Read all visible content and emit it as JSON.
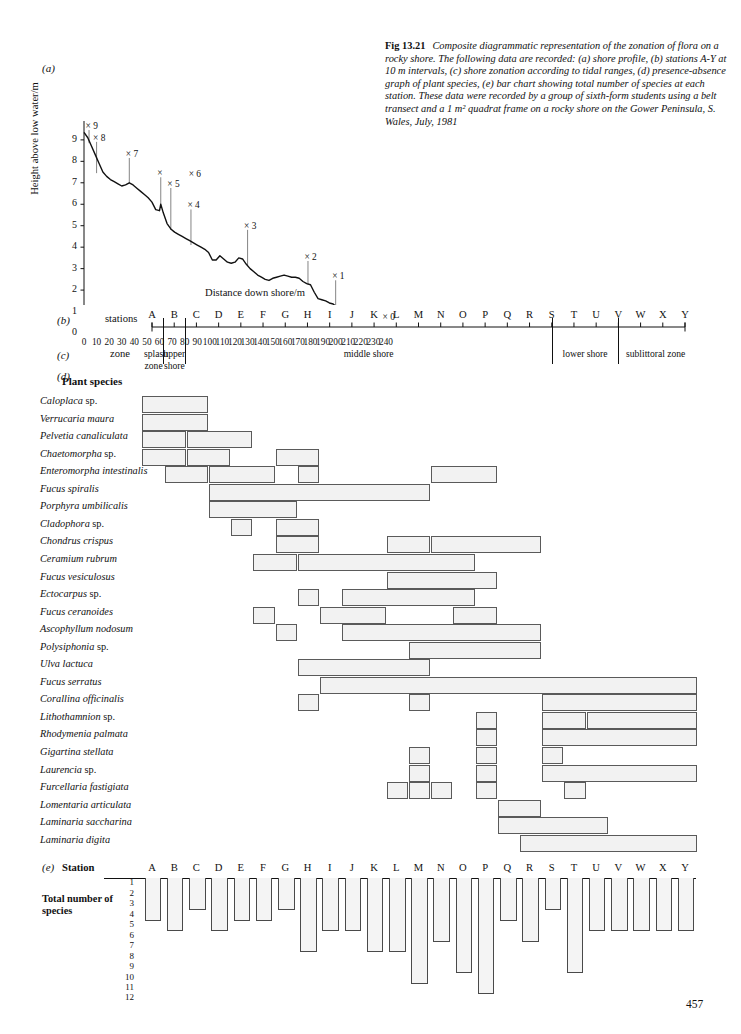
{
  "page_number": "457",
  "caption": {
    "fig_number": "Fig 13.21",
    "text": "Composite diagrammatic representation of the zonation of flora on a rocky shore. The following data are recorded: (a) shore profile, (b) stations A-Y at 10 m intervals, (c) shore zonation according to tidal ranges, (d) presence-absence graph of plant species, (e) bar chart showing total number of species at each station. These data were recorded by a group of sixth-form students using a belt transect and a 1 m² quadrat frame on a rocky shore on the Gower Peninsula, S. Wales, July, 1981"
  },
  "panels": {
    "a": "(a)",
    "b": "(b)",
    "c": "(c)",
    "d": "(d)",
    "e": "(e)"
  },
  "panel_b": {
    "row_label": "stations"
  },
  "panel_c": {
    "row_label": "zone"
  },
  "panel_d": {
    "heading": "Plant species"
  },
  "panel_e": {
    "row_label": "Station",
    "axis_label": "Total number of species"
  },
  "chart_data": [
    {
      "type": "line",
      "id": "shore-profile",
      "title": "(a) shore profile",
      "xlabel": "Distance down shore/m",
      "ylabel": "Height above low water/m",
      "xlim": [
        0,
        240
      ],
      "ylim": [
        0,
        9.6
      ],
      "xticks": [
        0,
        10,
        20,
        30,
        40,
        50,
        60,
        70,
        80,
        90,
        100,
        110,
        120,
        130,
        140,
        150,
        160,
        170,
        180,
        190,
        200,
        210,
        220,
        230,
        240
      ],
      "yticks": [
        0,
        1,
        2,
        3,
        4,
        5,
        6,
        7,
        8,
        9
      ],
      "grid": false,
      "x": [
        0,
        3,
        6,
        9,
        12,
        15,
        18,
        21,
        24,
        27,
        30,
        33,
        36,
        39,
        42,
        45,
        48,
        51,
        54,
        57,
        60,
        61,
        63,
        66,
        69,
        72,
        75,
        78,
        81,
        84,
        87,
        90,
        93,
        96,
        99,
        102,
        105,
        108,
        111,
        114,
        117,
        120,
        123,
        126,
        129,
        132,
        135,
        138,
        141,
        144,
        147,
        150,
        153,
        156,
        159,
        162,
        165,
        168,
        171,
        174,
        177,
        180,
        183,
        186,
        189,
        192,
        195,
        198,
        201,
        204,
        207,
        210,
        213,
        216,
        219,
        222,
        225,
        228,
        231,
        234,
        237,
        240
      ],
      "y": [
        9.35,
        9.1,
        8.7,
        8.3,
        7.9,
        7.5,
        7.3,
        7.15,
        7.05,
        6.95,
        6.85,
        6.9,
        7.0,
        6.9,
        6.75,
        6.6,
        6.45,
        6.3,
        6.1,
        5.75,
        5.7,
        6.0,
        5.6,
        5.1,
        4.85,
        4.7,
        4.6,
        4.5,
        4.4,
        4.3,
        4.2,
        4.1,
        4.0,
        3.9,
        3.75,
        3.4,
        3.4,
        3.6,
        3.45,
        3.3,
        3.25,
        3.3,
        3.5,
        3.45,
        3.2,
        3.0,
        2.85,
        2.7,
        2.6,
        2.5,
        2.45,
        2.55,
        2.6,
        2.65,
        2.7,
        2.65,
        2.6,
        2.6,
        2.55,
        2.4,
        2.3,
        2.25,
        1.9,
        1.6,
        1.55,
        1.5,
        1.4,
        1.35,
        1.2,
        1.1,
        1.0,
        0.95,
        0.9,
        0.8,
        0.7,
        0.6,
        0.5,
        0.45,
        0.4,
        0.35,
        0.3,
        0.2
      ],
      "annotations": [
        {
          "label": "9",
          "x": 4,
          "y_marker": 9.55,
          "y_base": 8.85
        },
        {
          "label": "8",
          "x": 10,
          "y_marker": 9.0,
          "y_base": 7.45
        },
        {
          "label": "7",
          "x": 36,
          "y_marker": 8.25,
          "y_base": 7.0
        },
        {
          "label": "",
          "x": 61,
          "y_marker": 7.35,
          "y_base": 6.0
        },
        {
          "label": "6",
          "x": 86,
          "y_marker": 7.3,
          "y_base": null
        },
        {
          "label": "5",
          "x": 69,
          "y_marker": 6.85,
          "y_base": 4.8
        },
        {
          "label": "4",
          "x": 85,
          "y_marker": 5.85,
          "y_base": 4.1
        },
        {
          "label": "3",
          "x": 130,
          "y_marker": 4.9,
          "y_base": 3.15
        },
        {
          "label": "2",
          "x": 178,
          "y_marker": 3.45,
          "y_base": 2.25
        },
        {
          "label": "1",
          "x": 200,
          "y_marker": 2.55,
          "y_base": 1.1
        },
        {
          "label": "0",
          "x": 240,
          "y_marker": 0.65,
          "y_base": null
        }
      ]
    },
    {
      "type": "bar",
      "id": "total-species",
      "title": "(e) bar chart showing total number of species at each station",
      "xlabel": "Station",
      "ylabel": "Total number of species",
      "direction": "downward",
      "ylim": [
        0,
        12
      ],
      "yticks": [
        1,
        2,
        3,
        4,
        5,
        6,
        7,
        8,
        9,
        10,
        11,
        12
      ],
      "categories": [
        "A",
        "B",
        "C",
        "D",
        "E",
        "F",
        "G",
        "H",
        "I",
        "J",
        "K",
        "L",
        "M",
        "N",
        "O",
        "P",
        "Q",
        "R",
        "S",
        "T",
        "U",
        "V",
        "W",
        "X",
        "Y"
      ],
      "values": [
        4,
        5,
        3,
        5,
        4,
        4,
        3,
        7,
        5,
        5,
        7,
        7,
        10,
        6,
        9,
        11,
        4,
        6,
        3,
        9,
        5,
        5,
        5,
        5,
        5
      ]
    }
  ],
  "stations": [
    "A",
    "B",
    "C",
    "D",
    "E",
    "F",
    "G",
    "H",
    "I",
    "J",
    "K",
    "L",
    "M",
    "N",
    "O",
    "P",
    "Q",
    "R",
    "S",
    "T",
    "U",
    "V",
    "W",
    "X",
    "Y"
  ],
  "zones": [
    {
      "name": "splash zone",
      "start": "A",
      "end": "A"
    },
    {
      "name": "upper shore",
      "start": "B",
      "end": "C"
    },
    {
      "name": "middle shore",
      "start": "C",
      "end": "S"
    },
    {
      "name": "lower shore",
      "start": "S",
      "end": "V"
    },
    {
      "name": "sublittoral zone",
      "start": "V",
      "end": "Y"
    }
  ],
  "species": [
    {
      "name": "Caloplaca",
      "suffix": "sp.",
      "ranges": [
        [
          "A",
          "C"
        ]
      ]
    },
    {
      "name": "Verrucaria maura",
      "suffix": "",
      "ranges": [
        [
          "A",
          "C"
        ]
      ]
    },
    {
      "name": "Pelvetia canaliculata",
      "suffix": "",
      "ranges": [
        [
          "A",
          "B"
        ],
        [
          "C",
          "E"
        ]
      ]
    },
    {
      "name": "Chaetomorpha",
      "suffix": "sp.",
      "ranges": [
        [
          "A",
          "B"
        ],
        [
          "C",
          "D"
        ],
        [
          "G",
          "H"
        ]
      ]
    },
    {
      "name": "Enteromorpha intestinalis",
      "suffix": "",
      "ranges": [
        [
          "B",
          "C"
        ],
        [
          "D",
          "F"
        ],
        [
          "H",
          "H"
        ],
        [
          "N",
          "P"
        ]
      ]
    },
    {
      "name": "Fucus spiralis",
      "suffix": "",
      "ranges": [
        [
          "D",
          "M"
        ]
      ]
    },
    {
      "name": "Porphyra umbilicalis",
      "suffix": "",
      "ranges": [
        [
          "D",
          "G"
        ]
      ]
    },
    {
      "name": "Cladophora",
      "suffix": "sp.",
      "ranges": [
        [
          "E",
          "E"
        ],
        [
          "G",
          "H"
        ]
      ]
    },
    {
      "name": "Chondrus crispus",
      "suffix": "",
      "ranges": [
        [
          "G",
          "H"
        ],
        [
          "L",
          "M"
        ],
        [
          "N",
          "R"
        ]
      ]
    },
    {
      "name": "Ceramium rubrum",
      "suffix": "",
      "ranges": [
        [
          "F",
          "G"
        ],
        [
          "H",
          "O"
        ]
      ]
    },
    {
      "name": "Fucus vesiculosus",
      "suffix": "",
      "ranges": [
        [
          "L",
          "P"
        ]
      ]
    },
    {
      "name": "Ectocarpus",
      "suffix": "sp.",
      "ranges": [
        [
          "H",
          "H"
        ],
        [
          "J",
          "O"
        ]
      ]
    },
    {
      "name": "Fucus ceranoides",
      "suffix": "",
      "ranges": [
        [
          "F",
          "F"
        ],
        [
          "I",
          "K"
        ],
        [
          "O",
          "P"
        ]
      ]
    },
    {
      "name": "Ascophyllum nodosum",
      "suffix": "",
      "ranges": [
        [
          "G",
          "G"
        ],
        [
          "J",
          "R"
        ]
      ]
    },
    {
      "name": "Polysiphonia",
      "suffix": "sp.",
      "ranges": [
        [
          "M",
          "R"
        ]
      ]
    },
    {
      "name": "Ulva lactuca",
      "suffix": "",
      "ranges": [
        [
          "H",
          "M"
        ]
      ]
    },
    {
      "name": "Fucus serratus",
      "suffix": "",
      "ranges": [
        [
          "I",
          "Y"
        ]
      ]
    },
    {
      "name": "Corallina officinalis",
      "suffix": "",
      "ranges": [
        [
          "H",
          "H"
        ],
        [
          "M",
          "M"
        ],
        [
          "S",
          "Y"
        ]
      ]
    },
    {
      "name": "Lithothamnion",
      "suffix": "sp.",
      "ranges": [
        [
          "P",
          "P"
        ],
        [
          "S",
          "T"
        ],
        [
          "U",
          "Y"
        ]
      ]
    },
    {
      "name": "Rhodymenia palmata",
      "suffix": "",
      "ranges": [
        [
          "P",
          "P"
        ],
        [
          "S",
          "Y"
        ]
      ]
    },
    {
      "name": "Gigartina stellata",
      "suffix": "",
      "ranges": [
        [
          "M",
          "M"
        ],
        [
          "P",
          "P"
        ],
        [
          "S",
          "S"
        ]
      ]
    },
    {
      "name": "Laurencia",
      "suffix": "sp.",
      "ranges": [
        [
          "M",
          "M"
        ],
        [
          "P",
          "P"
        ],
        [
          "S",
          "Y"
        ]
      ]
    },
    {
      "name": "Furcellaria fastigiata",
      "suffix": "",
      "ranges": [
        [
          "L",
          "L"
        ],
        [
          "M",
          "M"
        ],
        [
          "N",
          "N"
        ],
        [
          "P",
          "P"
        ],
        [
          "T",
          "T"
        ]
      ]
    },
    {
      "name": "Lomentaria articulata",
      "suffix": "",
      "ranges": [
        [
          "Q",
          "R"
        ]
      ]
    },
    {
      "name": "Laminaria saccharina",
      "suffix": "",
      "ranges": [
        [
          "Q",
          "U"
        ]
      ]
    },
    {
      "name": "Laminaria digita",
      "suffix": "",
      "ranges": [
        [
          "R",
          "Y"
        ]
      ]
    }
  ]
}
